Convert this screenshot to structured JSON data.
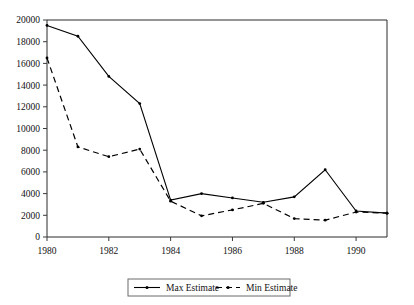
{
  "chart_data": {
    "type": "line",
    "title": "",
    "xlabel": "",
    "ylabel": "",
    "x": [
      1980,
      1981,
      1982,
      1983,
      1984,
      1985,
      1986,
      1987,
      1988,
      1989,
      1990,
      1991
    ],
    "series": [
      {
        "name": "Max Estimate",
        "style": "solid",
        "values": [
          19500,
          18500,
          14800,
          12300,
          3400,
          4000,
          3600,
          3200,
          3700,
          6200,
          2400,
          2200
        ]
      },
      {
        "name": "Min Estimate",
        "style": "dashed",
        "values": [
          16500,
          8300,
          7400,
          8100,
          3300,
          1950,
          2500,
          3100,
          1700,
          1550,
          2300,
          2200
        ]
      }
    ],
    "xlim": [
      1980,
      1991
    ],
    "ylim": [
      0,
      20000
    ],
    "xtick_labels": [
      "1980",
      "1982",
      "1984",
      "1986",
      "1988",
      "1990"
    ],
    "xtick_values": [
      1980,
      1982,
      1984,
      1986,
      1988,
      1990
    ],
    "ytick_labels": [
      "0",
      "2000",
      "4000",
      "6000",
      "8000",
      "10000",
      "12000",
      "14000",
      "16000",
      "18000",
      "20000"
    ],
    "ytick_values": [
      0,
      2000,
      4000,
      6000,
      8000,
      10000,
      12000,
      14000,
      16000,
      18000,
      20000
    ],
    "grid": false,
    "legend_position": "bottom-center",
    "legend_entries": [
      "Max Estimate",
      "Min Estimate"
    ]
  },
  "colors": {
    "series_max": "#000000",
    "series_min": "#000000",
    "axis": "#3a3a3a",
    "frame": "#2b2b2b",
    "background": "#ffffff"
  }
}
